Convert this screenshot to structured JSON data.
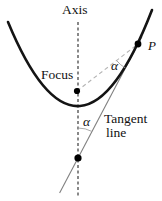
{
  "diagram": {
    "labels": {
      "axis": "Axis",
      "focus": "Focus",
      "point_p": "P",
      "angle_upper": "α",
      "angle_lower": "α",
      "tangent_word1": "Tangent",
      "tangent_word2": "line"
    },
    "colors": {
      "background": "#ffffff",
      "parabola": "#141414",
      "axis_line": "#3a3a3a",
      "focal_chord": "#b4b4b4",
      "tangent_line": "#808080",
      "angle_arc": "#a0a0a0",
      "point_dot": "#000000",
      "text": "#111111"
    }
  }
}
